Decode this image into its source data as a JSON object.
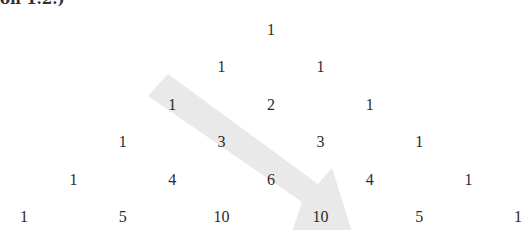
{
  "caption_fragment": "on 1.2.)",
  "diagram": {
    "type": "pascal-triangle",
    "rows": [
      [
        1
      ],
      [
        1,
        1
      ],
      [
        1,
        2,
        1
      ],
      [
        1,
        3,
        3,
        1
      ],
      [
        1,
        4,
        6,
        4,
        1
      ],
      [
        1,
        5,
        10,
        10,
        5,
        1
      ]
    ],
    "arrow": {
      "description": "diagonal shaded arrow along 1, 3, 6, 10",
      "color": "#e6e6e6",
      "highlighted_values": [
        1,
        3,
        6,
        10
      ]
    }
  }
}
